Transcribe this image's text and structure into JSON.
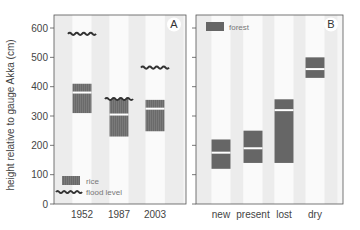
{
  "chart_data": [
    {
      "panel": "A",
      "type": "bar",
      "subtype": "floating-range",
      "ylabel": "height relative to gauge Akka (cm)",
      "xlabel": "",
      "ylim": [
        0,
        620
      ],
      "yticks": [
        0,
        100,
        200,
        300,
        400,
        500,
        600
      ],
      "categories": [
        "1952",
        "1987",
        "2003"
      ],
      "series": [
        {
          "name": "rice",
          "style": "hatched",
          "ranges": [
            {
              "category": "1952",
              "low": 310,
              "mid": 380,
              "high": 410
            },
            {
              "category": "1987",
              "low": 230,
              "mid": 305,
              "high": 358
            },
            {
              "category": "2003",
              "low": 248,
              "mid": 325,
              "high": 355
            }
          ]
        },
        {
          "name": "flood level",
          "style": "wave",
          "values": [
            580,
            358,
            465
          ]
        }
      ],
      "legend": [
        "rice",
        "flood level"
      ],
      "legend_position": "lower-left",
      "panel_label": "A"
    },
    {
      "panel": "B",
      "type": "bar",
      "subtype": "floating-range",
      "ylim": [
        0,
        620
      ],
      "yticks": [
        0,
        100,
        200,
        300,
        400,
        500,
        600
      ],
      "categories": [
        "new",
        "present",
        "lost",
        "dry"
      ],
      "series": [
        {
          "name": "forest",
          "style": "solid",
          "ranges": [
            {
              "category": "new",
              "low": 120,
              "mid": 175,
              "high": 220
            },
            {
              "category": "present",
              "low": 140,
              "mid": 190,
              "high": 250
            },
            {
              "category": "lost",
              "low": 140,
              "mid": 320,
              "high": 357
            },
            {
              "category": "dry",
              "low": 430,
              "mid": 460,
              "high": 500
            }
          ]
        }
      ],
      "legend": [
        "forest"
      ],
      "legend_position": "upper-left",
      "panel_label": "B"
    }
  ],
  "colors": {
    "bar": "#666666",
    "stripe_gray": "#ececec",
    "stripe_white": "#fafafa",
    "axis": "#555555",
    "text": "#444444",
    "wave": "#333333"
  }
}
